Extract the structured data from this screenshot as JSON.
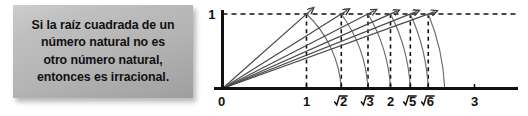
{
  "statement": {
    "lines": [
      "Si la raíz cuadrada de un",
      "número natural no es",
      "otro número natural,",
      "entonces es irracional."
    ]
  },
  "chart_data": {
    "type": "line",
    "title": "",
    "xlabel": "",
    "ylabel": "",
    "xlim": [
      0,
      3.45
    ],
    "ylim": [
      0,
      1.12
    ],
    "grid": false,
    "legend": null,
    "y_axis": {
      "tick_values": [
        0,
        1
      ],
      "tick_labels": [
        "0",
        "1"
      ],
      "value_line_at": 1,
      "value_line_style": "dashed"
    },
    "x_axis": {
      "tick_values": [
        1,
        1.41421356,
        1.73205081,
        2,
        2.23606798,
        2.44948975,
        3
      ],
      "tick_labels": [
        "1",
        "√2",
        "√3",
        "2",
        "√5",
        "√6",
        "3"
      ],
      "tick_label_kinds": [
        "integer",
        "radical",
        "radical",
        "integer",
        "radical",
        "radical",
        "integer"
      ],
      "radicands": [
        null,
        2,
        3,
        null,
        5,
        6,
        null
      ]
    },
    "origin_label": "0",
    "height_label": "1",
    "rays": [
      {
        "name": "ray-to-1",
        "from": [
          0,
          0
        ],
        "to": [
          1,
          1
        ],
        "arrow": true
      },
      {
        "name": "ray-to-r2",
        "from": [
          0,
          0
        ],
        "to": [
          1.41421356,
          1
        ],
        "arrow": true
      },
      {
        "name": "ray-to-r3",
        "from": [
          0,
          0
        ],
        "to": [
          1.73205081,
          1
        ],
        "arrow": true
      },
      {
        "name": "ray-to-2",
        "from": [
          0,
          0
        ],
        "to": [
          2,
          1
        ],
        "arrow": true
      },
      {
        "name": "ray-to-r5",
        "from": [
          0,
          0
        ],
        "to": [
          2.23606798,
          1
        ],
        "arrow": true
      },
      {
        "name": "ray-to-r6",
        "from": [
          0,
          0
        ],
        "to": [
          2.44948975,
          1
        ],
        "arrow": true
      }
    ],
    "vertical_dashed_lines": [
      1,
      1.41421356,
      1.73205081,
      2,
      2.23606798,
      2.44948975
    ],
    "arcs": [
      {
        "name": "arc-sqrt2",
        "from": [
          1,
          1
        ],
        "to": [
          1.41421356,
          0
        ]
      },
      {
        "name": "arc-sqrt3",
        "from": [
          1.41421356,
          1
        ],
        "to": [
          1.73205081,
          0
        ]
      },
      {
        "name": "arc-sqrt4",
        "from": [
          1.73205081,
          1
        ],
        "to": [
          2,
          0
        ]
      },
      {
        "name": "arc-sqrt5",
        "from": [
          2,
          1
        ],
        "to": [
          2.23606798,
          0
        ]
      },
      {
        "name": "arc-sqrt6",
        "from": [
          2.23606798,
          1
        ],
        "to": [
          2.44948975,
          0
        ]
      },
      {
        "name": "arc-sqrt7",
        "from": [
          2.44948975,
          1
        ],
        "to": [
          2.64575131,
          0
        ]
      }
    ],
    "colors": {
      "axis": "#111111",
      "dashed": "#111111",
      "ray": "#4a4a4a",
      "arc": "#6b6b6b",
      "text": "#111111",
      "box_background": "#b4b4b4"
    }
  }
}
